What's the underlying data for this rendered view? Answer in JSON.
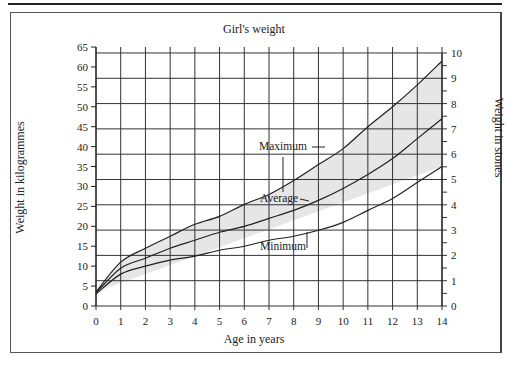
{
  "chart_data": {
    "type": "line",
    "title": "Girl's weight",
    "xlabel": "Age in years",
    "ylabel": "Weight in kilogrammes",
    "ylabel_right": "Weight in stones",
    "x": [
      0,
      1,
      2,
      3,
      4,
      5,
      6,
      7,
      8,
      9,
      10,
      11,
      12,
      13,
      14
    ],
    "xlim": [
      0,
      14
    ],
    "ylim": [
      0,
      65
    ],
    "ylim_right": [
      0,
      10
    ],
    "yticks": [
      0,
      5,
      10,
      15,
      20,
      25,
      30,
      35,
      40,
      45,
      50,
      55,
      60,
      65
    ],
    "yticks_right": [
      0,
      1,
      2,
      3,
      4,
      5,
      6,
      7,
      8,
      9,
      10
    ],
    "grid": true,
    "shaded_band": "between Maximum and Minimum",
    "series": [
      {
        "name": "Maximum",
        "values": [
          3.5,
          11,
          14.5,
          17.5,
          20.5,
          22.5,
          25.5,
          28,
          31.5,
          35.5,
          39.5,
          45,
          50,
          55.5,
          61.5
        ]
      },
      {
        "name": "Average",
        "values": [
          3.3,
          9.5,
          12,
          14.5,
          16.5,
          18.5,
          20,
          22,
          24,
          26.5,
          29.5,
          33,
          37,
          42,
          47
        ]
      },
      {
        "name": "Minimum",
        "values": [
          3,
          8,
          10,
          11.5,
          12.5,
          14,
          15,
          16.5,
          17.5,
          19,
          21,
          24,
          27,
          31,
          35
        ]
      }
    ],
    "annotations": [
      "Maximum",
      "Average",
      "Minimum"
    ]
  },
  "labels": {
    "title": "Girl's weight",
    "xlabel": "Age in years",
    "ylabel": "Weight in kilogrammes",
    "ylabel_right": "Weight in stones"
  },
  "colors": {
    "band": "#e6e6e6",
    "line": "#222222",
    "grid": "#333333"
  }
}
